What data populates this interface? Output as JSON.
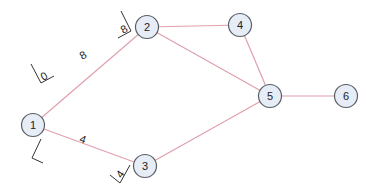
{
  "diagram": {
    "type": "graph",
    "colors": {
      "edge": "#e0a0ac",
      "node_fill": "#e6edf7",
      "node_stroke": "#5a5f66",
      "text": "#222222"
    },
    "nodes": [
      {
        "id": "1",
        "label": "1",
        "x": 33,
        "y": 125
      },
      {
        "id": "2",
        "label": "2",
        "x": 147,
        "y": 27
      },
      {
        "id": "3",
        "label": "3",
        "x": 145,
        "y": 166
      },
      {
        "id": "4",
        "label": "4",
        "x": 240,
        "y": 25
      },
      {
        "id": "5",
        "label": "5",
        "x": 270,
        "y": 96
      },
      {
        "id": "6",
        "label": "6",
        "x": 346,
        "y": 96
      }
    ],
    "edges": [
      {
        "from": "1",
        "to": "2",
        "weight": "8",
        "start_label": "0",
        "end_label": "8"
      },
      {
        "from": "1",
        "to": "3",
        "weight": "4",
        "start_label": "0",
        "end_label": "4"
      },
      {
        "from": "2",
        "to": "4"
      },
      {
        "from": "2",
        "to": "5"
      },
      {
        "from": "4",
        "to": "5"
      },
      {
        "from": "3",
        "to": "5"
      },
      {
        "from": "5",
        "to": "6"
      }
    ],
    "labels": {
      "e12_start": "0",
      "e12_mid": "8",
      "e12_end": "8",
      "e13_start": "0",
      "e13_mid": "4",
      "e13_end": "4"
    }
  }
}
